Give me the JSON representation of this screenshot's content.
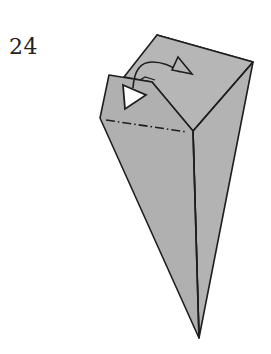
{
  "step": {
    "number": "24"
  },
  "diagram": {
    "colors": {
      "paper": "#b4b4b4",
      "paper_dark": "#a8a8a8",
      "line": "#1e1e1e",
      "arrow_fill": "#ffffff"
    },
    "elements": [
      "paper-shape",
      "center-crease",
      "front-flap",
      "mountain-fold-line",
      "tuck-arrow",
      "arrow-head-hollow",
      "arrow-tail-hollow"
    ]
  }
}
